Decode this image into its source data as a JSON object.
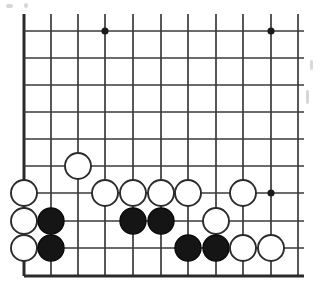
{
  "figure": {
    "kind": "go-board-diagram",
    "board_label": "",
    "background_color": "#ffffff",
    "line_color": "#3a3a3a",
    "edge_color": "#2b2b2b",
    "black_stone_color": "#151515",
    "white_stone_color": "#ffffff",
    "white_stone_outline": "#2b2b2b"
  },
  "board": {
    "visible_columns": 11,
    "visible_rows": 10,
    "cell_size_px": 27.4,
    "origin_x_px": 24,
    "origin_y_px": 31,
    "top_cropped": true,
    "right_cropped": true,
    "bottom_edge_row_index": 9,
    "left_edge_col_index": 0,
    "column_x_px": [
      24,
      51,
      78,
      105,
      133,
      161,
      188,
      216,
      243,
      271,
      298
    ],
    "row_y_px": [
      31,
      58,
      85,
      112,
      139,
      166,
      193,
      221,
      248,
      276
    ],
    "stone_radius_px": 13
  },
  "star_points": [
    {
      "col": 3,
      "row": 0,
      "label": "hoshi-top-left-area"
    },
    {
      "col": 9,
      "row": 0,
      "label": "hoshi-top-right"
    },
    {
      "col": 9,
      "row": 6,
      "label": "hoshi-bottom-right"
    }
  ],
  "stones": [
    {
      "color": "white",
      "col": 2,
      "row": 5,
      "id": "W1"
    },
    {
      "color": "white",
      "col": 0,
      "row": 6,
      "id": "W2"
    },
    {
      "color": "white",
      "col": 3,
      "row": 6,
      "id": "W3"
    },
    {
      "color": "white",
      "col": 4,
      "row": 6,
      "id": "W4"
    },
    {
      "color": "white",
      "col": 5,
      "row": 6,
      "id": "W5"
    },
    {
      "color": "white",
      "col": 6,
      "row": 6,
      "id": "W6"
    },
    {
      "color": "white",
      "col": 8,
      "row": 6,
      "id": "W7"
    },
    {
      "color": "white",
      "col": 0,
      "row": 7,
      "id": "W8"
    },
    {
      "color": "black",
      "col": 1,
      "row": 7,
      "id": "B1"
    },
    {
      "color": "black",
      "col": 4,
      "row": 7,
      "id": "B2"
    },
    {
      "color": "black",
      "col": 5,
      "row": 7,
      "id": "B3"
    },
    {
      "color": "white",
      "col": 7,
      "row": 7,
      "id": "W9"
    },
    {
      "color": "white",
      "col": 0,
      "row": 8,
      "id": "W10"
    },
    {
      "color": "black",
      "col": 1,
      "row": 8,
      "id": "B4"
    },
    {
      "color": "black",
      "col": 6,
      "row": 8,
      "id": "B5"
    },
    {
      "color": "black",
      "col": 7,
      "row": 8,
      "id": "B6"
    },
    {
      "color": "white",
      "col": 8,
      "row": 8,
      "id": "W11"
    },
    {
      "color": "white",
      "col": 9,
      "row": 8,
      "id": "W12"
    }
  ],
  "counts": {
    "black_stones": 6,
    "white_stones": 12,
    "total_stones": 18
  },
  "specks": [
    {
      "x": 6,
      "y": 4,
      "w": 7,
      "h": 4
    },
    {
      "x": 24,
      "y": 3,
      "w": 4,
      "h": 5
    },
    {
      "x": 306,
      "y": 90,
      "w": 3,
      "h": 14
    },
    {
      "x": 310,
      "y": 60,
      "w": 3,
      "h": 10
    }
  ]
}
